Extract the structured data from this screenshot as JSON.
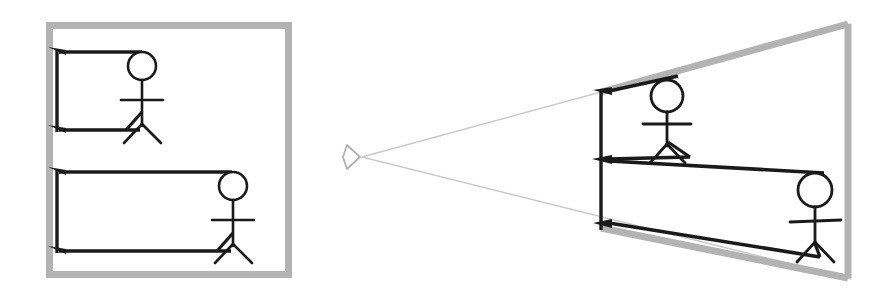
{
  "canvas": {
    "width": 884,
    "height": 295,
    "background": "#ffffff"
  },
  "colors": {
    "frame_gray": "#b3b3b3",
    "ray_gray": "#c9c9c9",
    "eye_gray": "#b0b0b0",
    "stroke_black": "#1a1a1a",
    "figure_black": "#1a1a1a"
  },
  "diagram": {
    "type": "projection-comparison",
    "panels": [
      {
        "id": "orthographic",
        "name": "orthographic-projection-panel",
        "frame": {
          "name": "orthographic-frame",
          "shape": "rectangle",
          "x": 46,
          "y": 22,
          "width": 246,
          "height": 256,
          "stroke": "#b3b3b3",
          "stroke_width": 7
        },
        "objects": [
          {
            "name": "stick-figure-near",
            "head": {
              "cx": 142,
              "cy": 66,
              "r": 14
            },
            "body": {
              "x": 142,
              "y1": 80,
              "y2": 140
            },
            "arms": {
              "y": 100,
              "x1": 121,
              "x2": 163
            },
            "legs": {
              "hip_x": 142,
              "hip_y": 124,
              "foot_left_x": 124,
              "foot_right_x": 160,
              "foot_y": 143
            }
          },
          {
            "name": "stick-figure-far",
            "head": {
              "cx": 233,
              "cy": 186,
              "r": 14
            },
            "body": {
              "x": 233,
              "y1": 200,
              "y2": 260
            },
            "arms": {
              "y": 220,
              "x1": 212,
              "x2": 254
            },
            "legs": {
              "hip_x": 233,
              "hip_y": 244,
              "foot_left_x": 215,
              "foot_right_x": 251,
              "foot_y": 263
            }
          }
        ],
        "projection_rays": [
          {
            "name": "ray-top-near",
            "points": "142,52 59,52",
            "arrow_at": "59,52"
          },
          {
            "name": "ray-bottom-near",
            "points": "140,130 59,130",
            "arrow_at": "59,130"
          },
          {
            "name": "ray-top-far",
            "points": "232,172 59,172",
            "arrow_at": "59,172"
          },
          {
            "name": "ray-bottom-far",
            "points": "231,251 59,251",
            "arrow_at": "59,251"
          }
        ]
      },
      {
        "id": "perspective",
        "name": "perspective-projection-panel",
        "eye": {
          "name": "eye-point",
          "x": 360,
          "y": 157,
          "label": "viewpoint"
        },
        "frame": {
          "name": "perspective-frame",
          "shape": "trapezoid",
          "points": "851,22 851,280 601,228 601,92",
          "stroke": "#b3b3b3",
          "stroke_width": 7
        },
        "view_frustum": [
          {
            "name": "frustum-ray-upper",
            "points": "360,157 851,22"
          },
          {
            "name": "frustum-ray-lower",
            "points": "360,157 851,280"
          }
        ],
        "near_plane": {
          "name": "near-plane-line",
          "x": 601,
          "y1": 92,
          "y2": 228
        },
        "objects": [
          {
            "name": "stick-figure-near",
            "head": {
              "cx": 667,
              "cy": 96,
              "r": 16
            },
            "body": {
              "x": 667,
              "y1": 112,
              "y2": 160
            },
            "arms": {
              "y": 124,
              "x1": 643,
              "x2": 691
            },
            "legs": {
              "hip_x": 667,
              "hip_y": 144,
              "foot_left_x": 649,
              "foot_right_x": 685,
              "foot_y": 163
            }
          },
          {
            "name": "stick-figure-far",
            "head": {
              "cx": 815,
              "cy": 190,
              "r": 17
            },
            "body": {
              "x": 815,
              "y1": 207,
              "y2": 252
            },
            "arms": {
              "y": 221,
              "x1": 790,
              "x2": 840,
              "y_tilt": 2
            },
            "legs": {
              "hip_x": 815,
              "hip_y": 242,
              "foot_left_x": 796,
              "foot_right_x": 833,
              "foot_y": 262
            }
          }
        ],
        "projection_rays": [
          {
            "name": "ray-top-near",
            "points": "667,80 608,92",
            "arrow_at": "608,92"
          },
          {
            "name": "ray-bottom-near",
            "points": "665,156 608,160",
            "arrow_at": "608,160"
          },
          {
            "name": "ray-top-far",
            "points": "812,174 608,160",
            "arrow_at": "608,160"
          },
          {
            "name": "ray-bottom-far",
            "points": "810,258 608,224",
            "arrow_at": "608,224"
          }
        ]
      }
    ]
  }
}
